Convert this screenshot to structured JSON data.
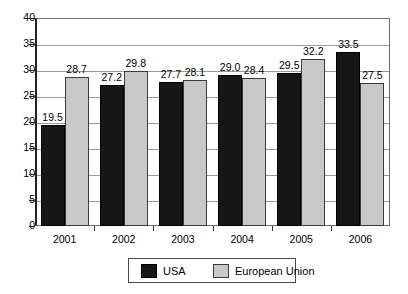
{
  "chart_data": {
    "type": "bar",
    "title": "",
    "subtitle": "",
    "xlabel": "",
    "ylabel": "",
    "categories": [
      "2001",
      "2002",
      "2003",
      "2004",
      "2005",
      "2006"
    ],
    "series": [
      {
        "name": "USA",
        "color": "#161616",
        "values": [
          19.5,
          27.2,
          27.7,
          29.0,
          29.5,
          33.5
        ],
        "labels": [
          "19.5",
          "27.2",
          "27.7",
          "29.0",
          "29.5",
          "33.5"
        ]
      },
      {
        "name": "European Union",
        "color": "#c9c9c9",
        "values": [
          28.7,
          29.8,
          28.1,
          28.4,
          32.2,
          27.5
        ],
        "labels": [
          "28.7",
          "29.8",
          "28.1",
          "28.4",
          "32.2",
          "27.5"
        ]
      }
    ],
    "ylim": [
      0,
      40
    ],
    "ytick_values": [
      0,
      5,
      10,
      15,
      20,
      25,
      30,
      35,
      40
    ],
    "ytick_labels": [
      "0",
      "5",
      "10",
      "15",
      "20",
      "25",
      "30",
      "35",
      "40"
    ],
    "grid": true,
    "grid_axis": "y",
    "legend_position": "bottom-center",
    "annotations": []
  },
  "legend": {
    "entries": [
      {
        "label": "USA",
        "swatch": "black-square"
      },
      {
        "label": "European Union",
        "swatch": "gray-square"
      }
    ]
  }
}
